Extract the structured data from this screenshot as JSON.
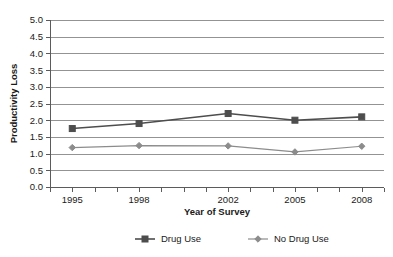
{
  "chart_data": {
    "type": "line",
    "title": "",
    "xlabel": "Year of Survey",
    "ylabel": "Productivity Loss",
    "categories": [
      "1995",
      "1998",
      "2002",
      "2005",
      "2008"
    ],
    "x": [
      1995,
      1998,
      2002,
      2005,
      2008
    ],
    "xlim": [
      1994,
      2009
    ],
    "ylim": [
      0.0,
      5.0
    ],
    "ytick_labels": [
      "0.0",
      "0.5",
      "1.0",
      "1.5",
      "2.0",
      "2.5",
      "3.0",
      "3.5",
      "4.0",
      "4.5",
      "5.0"
    ],
    "ytick_values": [
      0.0,
      0.5,
      1.0,
      1.5,
      2.0,
      2.5,
      3.0,
      3.5,
      4.0,
      4.5,
      5.0
    ],
    "xtick_labels": [
      "1995",
      "1998",
      "2002",
      "2005",
      "2008"
    ],
    "xtick_values": [
      1995,
      1998,
      2002,
      2005,
      2008
    ],
    "x_minor_ticks": [
      1994,
      1995,
      1996,
      1997,
      1998,
      1999,
      2000,
      2001,
      2002,
      2003,
      2004,
      2005,
      2006,
      2007,
      2008,
      2009
    ],
    "grid": "horizontal",
    "legend_position": "bottom",
    "series": [
      {
        "name": "Drug Use",
        "values": [
          1.75,
          1.9,
          2.2,
          2.0,
          2.1
        ],
        "color": "#4d4d4d",
        "marker": "square"
      },
      {
        "name": "No Drug Use",
        "values": [
          1.18,
          1.24,
          1.23,
          1.05,
          1.22
        ],
        "color": "#8c8c8c",
        "marker": "diamond"
      }
    ]
  },
  "legend": {
    "items": [
      {
        "label": "Drug Use"
      },
      {
        "label": "No Drug Use"
      }
    ]
  },
  "colors": {
    "series_drug_use": "#4d4d4d",
    "series_no_drug_use": "#8c8c8c",
    "gridline": "#939393",
    "axis": "#5b5b5b",
    "text": "#1a1a1a",
    "background": "#ffffff"
  }
}
